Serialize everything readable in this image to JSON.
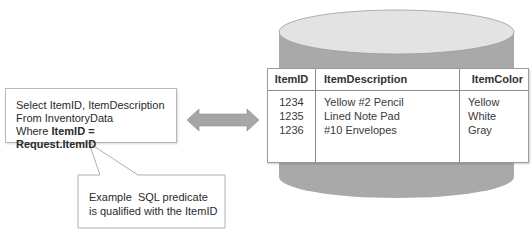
{
  "sql_box": {
    "line1": "Select ItemID, ItemDescription",
    "line2": "From InventoryData",
    "line3_prefix": "Where ",
    "line3_bold": "ItemID = Request.ItemID"
  },
  "callout": {
    "line1": "Example  SQL predicate",
    "line2": "is qualified with the ItemID"
  },
  "arrow": {
    "type": "double-headed",
    "color": "#a6a6a6"
  },
  "database": {
    "shape": "cylinder",
    "top_color": "#e4e4e4",
    "side_color": "#a8a8a8",
    "table": {
      "headers": [
        "ItemID",
        "ItemDescription",
        "ItemColor"
      ],
      "rows": [
        [
          "1234",
          "Yellow #2 Pencil",
          "Yellow"
        ],
        [
          "1235",
          "Lined Note Pad",
          "White"
        ],
        [
          "1236",
          "#10 Envelopes",
          "Gray"
        ]
      ]
    }
  }
}
